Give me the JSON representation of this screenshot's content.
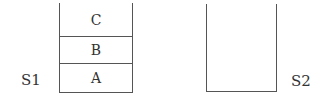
{
  "diagram": {
    "type": "stacks",
    "stacks": [
      {
        "name": "S1",
        "items_bottom_to_top": [
          "A",
          "B",
          "C"
        ],
        "cells": [
          {
            "label": "C"
          },
          {
            "label": "B"
          },
          {
            "label": "A"
          }
        ]
      },
      {
        "name": "S2",
        "items_bottom_to_top": []
      }
    ]
  }
}
